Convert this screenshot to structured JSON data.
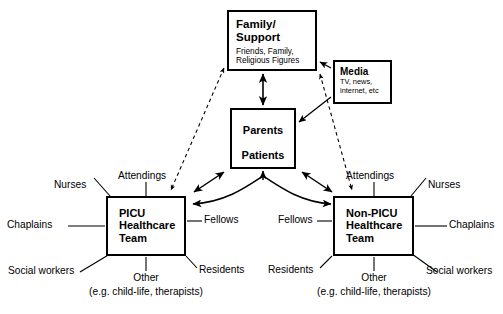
{
  "diagram": {
    "nodes": {
      "family": {
        "title_line1": "Family/",
        "title_line2": "Support",
        "sub_line1": "Friends, Family,",
        "sub_line2": "Religious Figures"
      },
      "media": {
        "title": "Media",
        "sub_line1": "TV, news,",
        "sub_line2": "internet, etc"
      },
      "parents_patients": {
        "top": "Parents",
        "bottom": "Patients"
      },
      "picu_team": {
        "line1": "PICU",
        "line2": "Healthcare",
        "line3": "Team"
      },
      "nonpicu_team": {
        "line1": "Non-PICU",
        "line2": "Healthcare",
        "line3": "Team"
      }
    },
    "picu_members": {
      "attendings": "Attendings",
      "nurses": "Nurses",
      "chaplains": "Chaplains",
      "social_workers": "Social workers",
      "fellows": "Fellows",
      "residents": "Residents",
      "other": "Other",
      "other_detail": "(e.g. child-life, therapists)"
    },
    "nonpicu_members": {
      "attendings": "Attendings",
      "nurses": "Nurses",
      "chaplains": "Chaplains",
      "social_workers": "Social workers",
      "fellows": "Fellows",
      "residents": "Residents",
      "other": "Other",
      "other_detail": "(e.g. child-life, therapists)"
    },
    "colors": {
      "stroke": "#000000",
      "background": "#ffffff",
      "text": "#000000"
    },
    "edges": [
      {
        "from": "family",
        "to": "parents_patients",
        "style": "solid",
        "arrow": "double"
      },
      {
        "from": "media",
        "to": "family",
        "style": "solid",
        "arrow": "single"
      },
      {
        "from": "media",
        "to": "parents_patients",
        "style": "solid",
        "arrow": "single"
      },
      {
        "from": "family",
        "to": "picu_team",
        "style": "dashed",
        "arrow": "double"
      },
      {
        "from": "family",
        "to": "nonpicu_team",
        "style": "dashed",
        "arrow": "double"
      },
      {
        "from": "parents_patients",
        "to": "picu_team",
        "style": "solid",
        "arrow": "double"
      },
      {
        "from": "parents_patients",
        "to": "nonpicu_team",
        "style": "solid",
        "arrow": "double"
      },
      {
        "from": "picu_team",
        "to": "nonpicu_team",
        "style": "solid-curved",
        "arrow": "double"
      },
      {
        "from": "parents",
        "to": "patients",
        "style": "solid",
        "arrow": "double"
      }
    ]
  }
}
